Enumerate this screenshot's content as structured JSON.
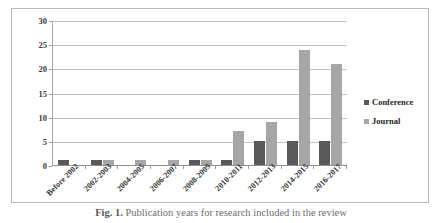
{
  "chart_data": {
    "type": "bar",
    "title": "",
    "xlabel": "",
    "ylabel": "",
    "ylim": [
      0,
      30
    ],
    "yticks": [
      0,
      5,
      10,
      15,
      20,
      25,
      30
    ],
    "grid": true,
    "legend_position": "right",
    "categories": [
      "Before 2002",
      "2002-2003",
      "2004-2005",
      "2006-2007",
      "2008-2009",
      "2010-2011",
      "2012-2013",
      "2014-2015",
      "2016-2017"
    ],
    "series": [
      {
        "name": "Conference",
        "color": "#595959",
        "values": [
          1,
          1,
          0,
          0,
          1,
          1,
          5,
          5,
          5
        ]
      },
      {
        "name": "Journal",
        "color": "#a6a6a6",
        "values": [
          0,
          1,
          1,
          1,
          1,
          7,
          9,
          24,
          21
        ]
      }
    ]
  },
  "legend": {
    "items": [
      {
        "label": "Conference",
        "color": "#595959"
      },
      {
        "label": "Journal",
        "color": "#a6a6a6"
      }
    ]
  },
  "caption": {
    "prefix": "Fig. 1.",
    "text": "Publication years for research included in the review"
  },
  "colors": {
    "conference": "#595959",
    "journal": "#a6a6a6",
    "gridline": "#c3c3c3",
    "frame": "#b9b9b9",
    "text": "#3a3a3a"
  }
}
